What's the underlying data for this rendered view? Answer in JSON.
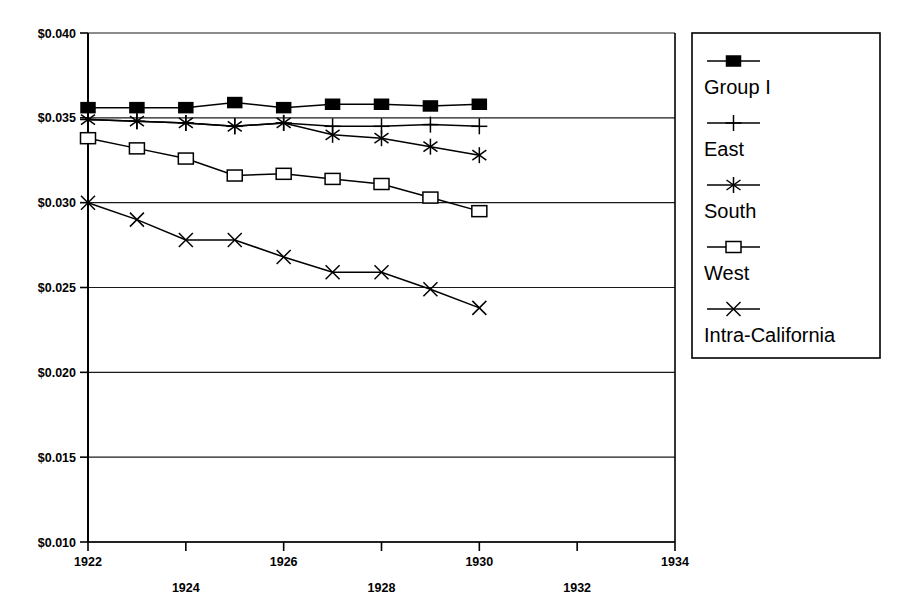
{
  "chart_data": {
    "type": "line",
    "title": "",
    "subtitle": "",
    "xlabel": "",
    "ylabel": "",
    "xlim": [
      1922,
      1934
    ],
    "ylim": [
      0.01,
      0.04
    ],
    "x_tick_labels": [
      "1922",
      "1924",
      "1926",
      "1928",
      "1930",
      "1932",
      "1934"
    ],
    "x_ticks": [
      1922,
      1924,
      1926,
      1928,
      1930,
      1932,
      1934
    ],
    "y_ticks": [
      0.01,
      0.015,
      0.02,
      0.025,
      0.03,
      0.035,
      0.04
    ],
    "y_tick_labels": [
      "$0.010",
      "$0.015",
      "$0.020",
      "$0.025",
      "$0.030",
      "$0.035",
      "$0.040"
    ],
    "grid": "horizontal",
    "legend_position": "right-outside",
    "x": [
      1922,
      1923,
      1924,
      1925,
      1926,
      1927,
      1928,
      1929,
      1930
    ],
    "series": [
      {
        "name": "Group I",
        "marker": "filled-square",
        "values": [
          0.0356,
          0.0356,
          0.0356,
          0.0359,
          0.0356,
          0.0358,
          0.0358,
          0.0357,
          0.0358
        ]
      },
      {
        "name": "East",
        "marker": "plus",
        "values": [
          0.0349,
          0.0348,
          0.0347,
          0.0345,
          0.0347,
          0.0345,
          0.0345,
          0.0346,
          0.0345
        ]
      },
      {
        "name": "South",
        "marker": "asterisk",
        "values": [
          0.0349,
          0.0348,
          0.0347,
          0.0345,
          0.0347,
          0.034,
          0.0338,
          0.0333,
          0.0328
        ]
      },
      {
        "name": "West",
        "marker": "open-square",
        "values": [
          0.0338,
          0.0332,
          0.0326,
          0.0316,
          0.0317,
          0.0314,
          0.0311,
          0.0303,
          0.0295
        ]
      },
      {
        "name": "Intra-California",
        "marker": "x",
        "values": [
          0.03,
          0.029,
          0.0278,
          0.0278,
          0.0268,
          0.0259,
          0.0259,
          0.0249,
          0.0238
        ]
      }
    ]
  },
  "legend": {
    "entries": [
      {
        "label": "Group I"
      },
      {
        "label": "East"
      },
      {
        "label": "South"
      },
      {
        "label": "West"
      },
      {
        "label": "Intra-California"
      }
    ]
  },
  "colors": {
    "background": "#ffffff",
    "ink": "#000000",
    "grid": "#1a1a1a"
  }
}
